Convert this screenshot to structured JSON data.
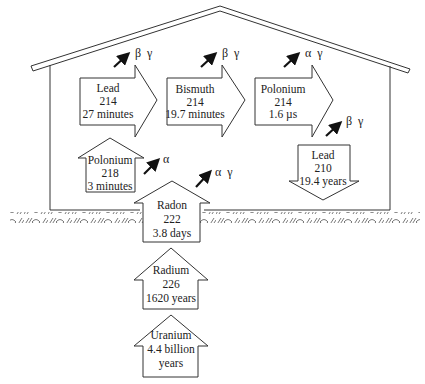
{
  "diagram": {
    "colors": {
      "line": "#333333",
      "background": "#ffffff",
      "text": "#222222"
    },
    "nuclides": [
      {
        "id": "uranium",
        "name": "Uranium",
        "mass": "",
        "half_life_line1": "4.4 billion",
        "half_life_line2": "years",
        "direction": "up"
      },
      {
        "id": "radium",
        "name": "Radium",
        "mass": "226",
        "half_life": "1620 years",
        "direction": "up"
      },
      {
        "id": "radon",
        "name": "Radon",
        "mass": "222",
        "half_life": "3.8 days",
        "direction": "up"
      },
      {
        "id": "polonium218",
        "name": "Polonium",
        "mass": "218",
        "half_life": "3 minutes",
        "direction": "up"
      },
      {
        "id": "lead214",
        "name": "Lead",
        "mass": "214",
        "half_life": "27 minutes",
        "direction": "right"
      },
      {
        "id": "bismuth214",
        "name": "Bismuth",
        "mass": "214",
        "half_life": "19.7 minutes",
        "direction": "right"
      },
      {
        "id": "polonium214",
        "name": "Polonium",
        "mass": "214",
        "half_life": "1.6 µs",
        "direction": "right"
      },
      {
        "id": "lead210",
        "name": "Lead",
        "mass": "210",
        "half_life": "19.4 years",
        "direction": "down"
      }
    ],
    "emissions": [
      {
        "from": "radon",
        "label": "α  γ"
      },
      {
        "from": "polonium218",
        "label": "α"
      },
      {
        "from": "lead214",
        "label": "β  γ"
      },
      {
        "from": "bismuth214",
        "label": "β  γ"
      },
      {
        "from": "polonium214",
        "label": "α  γ"
      },
      {
        "from": "polonium214_to_lead210",
        "label": "β  γ"
      }
    ]
  }
}
